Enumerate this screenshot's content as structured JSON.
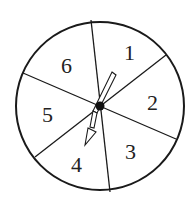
{
  "spinner": {
    "sections": [
      {
        "label": "1",
        "x": 124,
        "y": 60
      },
      {
        "label": "2",
        "x": 153,
        "y": 110
      },
      {
        "label": "3",
        "x": 131,
        "y": 159
      },
      {
        "label": "4",
        "x": 77,
        "y": 172
      },
      {
        "label": "5",
        "x": 48,
        "y": 122
      },
      {
        "label": "6",
        "x": 67,
        "y": 73
      }
    ],
    "colors": {
      "stroke": "#1a1a1a",
      "fill": "#ffffff"
    }
  }
}
